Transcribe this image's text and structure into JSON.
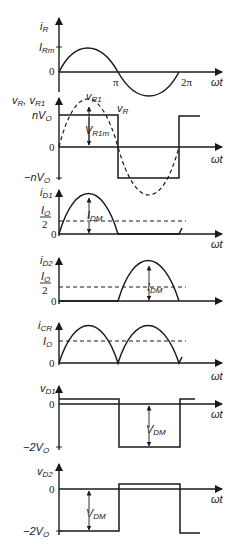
{
  "panels": [
    {
      "id": "iR",
      "ylabel": "i",
      "ylabel_sub": "R",
      "ticks": [
        {
          "label": "I",
          "sub": "Rm"
        },
        {
          "label": "0"
        }
      ],
      "x_ticks": [
        "π",
        "2π"
      ],
      "xlabel": "ωt"
    },
    {
      "id": "vR",
      "ylabel": "v",
      "ylabel_sub": "R",
      "ylabel2": "v",
      "ylabel2_sub": "R1",
      "ticks": [
        {
          "label": "nV",
          "sub": "O"
        },
        {
          "label": "0"
        },
        {
          "label": "−nV",
          "sub": "O"
        }
      ],
      "annotations": [
        {
          "label": "v",
          "sub": "R1"
        },
        {
          "label": "v",
          "sub": "R"
        },
        {
          "label": "V",
          "sub": "R1m"
        }
      ],
      "xlabel": "ωt"
    },
    {
      "id": "iD1",
      "ylabel": "i",
      "ylabel_sub": "D1",
      "ticks": [
        {
          "label": "I",
          "sub": "O",
          "den": "2"
        },
        {
          "label": "0"
        }
      ],
      "annotations": [
        {
          "label": "I",
          "sub": "DM"
        }
      ],
      "xlabel": "ωt"
    },
    {
      "id": "iD2",
      "ylabel": "i",
      "ylabel_sub": "D2",
      "ticks": [
        {
          "label": "I",
          "sub": "O",
          "den": "2"
        },
        {
          "label": "0"
        }
      ],
      "annotations": [
        {
          "label": "I",
          "sub": "DM"
        }
      ]
    },
    {
      "id": "iCR",
      "ylabel": "i",
      "ylabel_sub": "CR",
      "ticks": [
        {
          "label": "I",
          "sub": "O"
        },
        {
          "label": "0"
        }
      ],
      "xlabel": "ωt"
    },
    {
      "id": "vD1",
      "ylabel": "v",
      "ylabel_sub": "D1",
      "ticks": [
        {
          "label": "0"
        },
        {
          "label": "−2V",
          "sub": "O"
        }
      ],
      "annotations": [
        {
          "label": "V",
          "sub": "DM"
        }
      ],
      "xlabel": "ωt"
    },
    {
      "id": "vD2",
      "ylabel": "v",
      "ylabel_sub": "D2",
      "ticks": [
        {
          "label": "0"
        },
        {
          "label": "−2V",
          "sub": "O"
        }
      ],
      "annotations": [
        {
          "label": "V",
          "sub": "DM"
        }
      ],
      "xlabel": "ωt"
    }
  ]
}
